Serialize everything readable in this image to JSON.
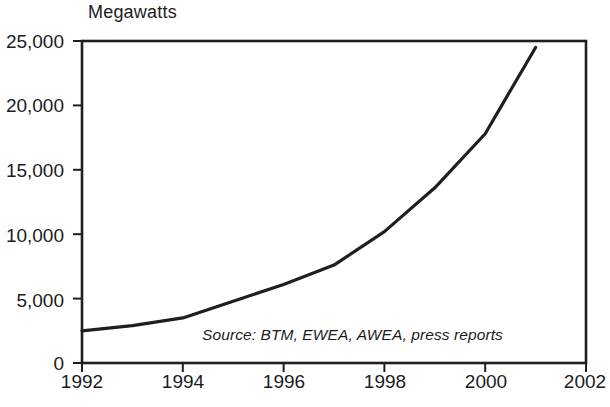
{
  "chart_data": {
    "type": "line",
    "title": "Megawatts",
    "xlabel": "",
    "ylabel": "Megawatts",
    "grid": false,
    "legend": null,
    "xlim": [
      1992,
      2002
    ],
    "ylim": [
      0,
      25000
    ],
    "xticks": [
      "1992",
      "1994",
      "1996",
      "1998",
      "2000",
      "2002"
    ],
    "xtick_values": [
      1992,
      1994,
      1996,
      1998,
      2000,
      2002
    ],
    "yticks": [
      "0",
      "5,000",
      "10,000",
      "15,000",
      "20,000",
      "25,000"
    ],
    "ytick_values": [
      0,
      5000,
      10000,
      15000,
      20000,
      25000
    ],
    "annotations": [
      {
        "name": "source-note",
        "text": "Source: BTM, EWEA, AWEA, press reports"
      }
    ],
    "series": [
      {
        "name": "Global installed wind energy capacity",
        "color": "#1f1f1f",
        "x": [
          1992,
          1993,
          1994,
          1995,
          1996,
          1997,
          1998,
          1999,
          2000,
          2001
        ],
        "values": [
          2500,
          2900,
          3500,
          4800,
          6100,
          7600,
          10200,
          13600,
          17800,
          24500
        ]
      }
    ]
  },
  "style": {
    "line_color": "#1f1f1f",
    "frame_color": "#1f1f1f",
    "text_color": "#1c1c1c",
    "background": "#ffffff"
  }
}
